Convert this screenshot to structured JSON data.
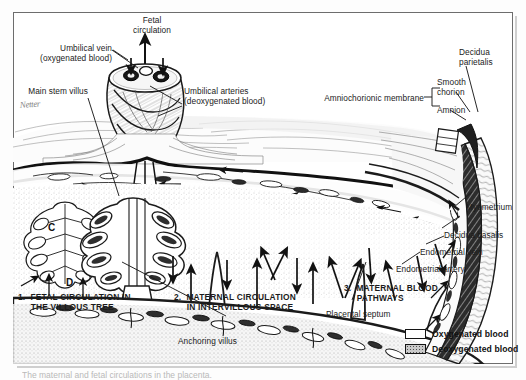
{
  "figure": {
    "artist_signature": "Netter",
    "caption_clipped": "The maternal and fetal circulations in the placenta."
  },
  "labels": {
    "fetal_circulation": "Fetal\ncirculation",
    "umbilical_vein": "Umbilical vein\n(oxygenated blood)",
    "umbilical_arteries": "Umbilical arteries\n(deoxygenated blood)",
    "main_stem_villus": "Main stem villus",
    "amniochorionic_membrane": "Amniochorionic membrane",
    "smooth_chorion": "Smooth\nchorion",
    "amnion": "Amnion",
    "decidua_parietalis": "Decidua\nparietalis",
    "myometrium": "Myometrium",
    "decidua_basalis": "Decidua basalis",
    "endometrial_vein": "Endometrial vein",
    "endometrial_artery": "Endometrial artery",
    "placental_septum": "Placental septum",
    "anchoring_villus": "Anchoring villus"
  },
  "numbered": {
    "one": "1.  FETAL CIRCULATION IN\n     THE VILLOUS TREE",
    "two": "2.  MATERNAL CIRCULATION\n     IN INTERVILLOUS SPACE",
    "three": "3.  MATERNAL BLOOD\n     PATHWAYS"
  },
  "markers": {
    "c": "C",
    "d": "D"
  },
  "legend": {
    "oxygenated": "Oxygenated blood",
    "deoxygenated": "Deoxygenated blood"
  },
  "colors": {
    "ink": "#1b1b1b",
    "frame": "#6d6d6d",
    "oxygenated_fill": "#ffffff",
    "deoxygenated_fill": "#c9c9c9",
    "paper": "#ffffff"
  }
}
